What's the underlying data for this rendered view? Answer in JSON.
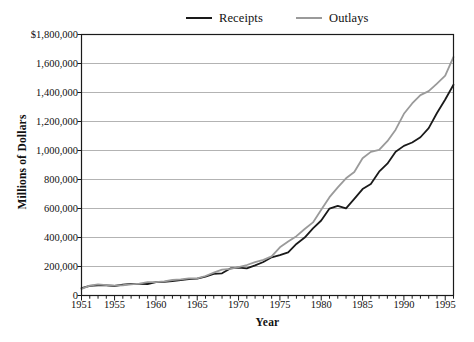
{
  "chart_data": {
    "type": "line",
    "title": "",
    "xlabel": "Year",
    "ylabel": "Millions of Dollars",
    "xlim": [
      1951,
      1996
    ],
    "ylim": [
      0,
      1800000
    ],
    "grid": true,
    "legend_position": "top-center",
    "y_ticks": [
      0,
      200000,
      400000,
      600000,
      800000,
      1000000,
      1200000,
      1400000,
      1600000,
      1800000
    ],
    "y_tick_labels": [
      "0",
      "200,000",
      "400,000",
      "600,000",
      "800,000",
      "1,000,000",
      "1,200,000",
      "1,400,000",
      "1,600,000",
      "$1,800,000"
    ],
    "x_ticks": [
      1951,
      1955,
      1960,
      1965,
      1970,
      1975,
      1980,
      1985,
      1990,
      1995
    ],
    "x_tick_labels": [
      "1951",
      "1955",
      "1960",
      "1965",
      "1970",
      "1975",
      "1980",
      "1985",
      "1990",
      "1995"
    ],
    "x": [
      1951,
      1952,
      1953,
      1954,
      1955,
      1956,
      1957,
      1958,
      1959,
      1960,
      1961,
      1962,
      1963,
      1964,
      1965,
      1966,
      1967,
      1968,
      1969,
      1970,
      1971,
      1972,
      1973,
      1974,
      1975,
      1976,
      1977,
      1978,
      1979,
      1980,
      1981,
      1982,
      1983,
      1984,
      1985,
      1986,
      1987,
      1988,
      1989,
      1990,
      1991,
      1992,
      1993,
      1994,
      1995,
      1996
    ],
    "series": [
      {
        "name": "Receipts",
        "color": "#1a1a1a",
        "values": [
          51600,
          66200,
          69600,
          69700,
          65500,
          74600,
          80000,
          79600,
          79200,
          92500,
          94400,
          99700,
          106600,
          112600,
          116800,
          130800,
          148800,
          153000,
          186900,
          192800,
          187100,
          207300,
          230800,
          263200,
          279100,
          298100,
          355600,
          399600,
          463300,
          517100,
          599300,
          617800,
          600600,
          666400,
          734000,
          769200,
          854300,
          909200,
          991100,
          1032000,
          1055000,
          1091300,
          1154400,
          1258600,
          1351800,
          1453100
        ]
      },
      {
        "name": "Outlays",
        "color": "#9a9a9a",
        "values": [
          45500,
          67700,
          76100,
          70900,
          68400,
          70600,
          76600,
          82400,
          92100,
          92200,
          97700,
          106800,
          111300,
          118500,
          118200,
          134500,
          157500,
          178100,
          183600,
          195600,
          210200,
          230700,
          245700,
          269400,
          332300,
          371800,
          409200,
          458700,
          504000,
          590900,
          678200,
          745700,
          808400,
          851800,
          946400,
          990300,
          1004000,
          1064400,
          1143700,
          1253000,
          1324400,
          1381700,
          1409400,
          1461700,
          1515700,
          1645000
        ]
      }
    ]
  },
  "legend": {
    "receipts_label": "Receipts",
    "outlays_label": "Outlays"
  },
  "axes": {
    "y_title": "Millions of Dollars",
    "x_title": "Year"
  },
  "colors": {
    "receipts_line": "#1a1a1a",
    "outlays_line": "#9a9a9a",
    "gridline": "#b3b3b3",
    "frame": "#1a1a1a",
    "background": "#ffffff"
  }
}
